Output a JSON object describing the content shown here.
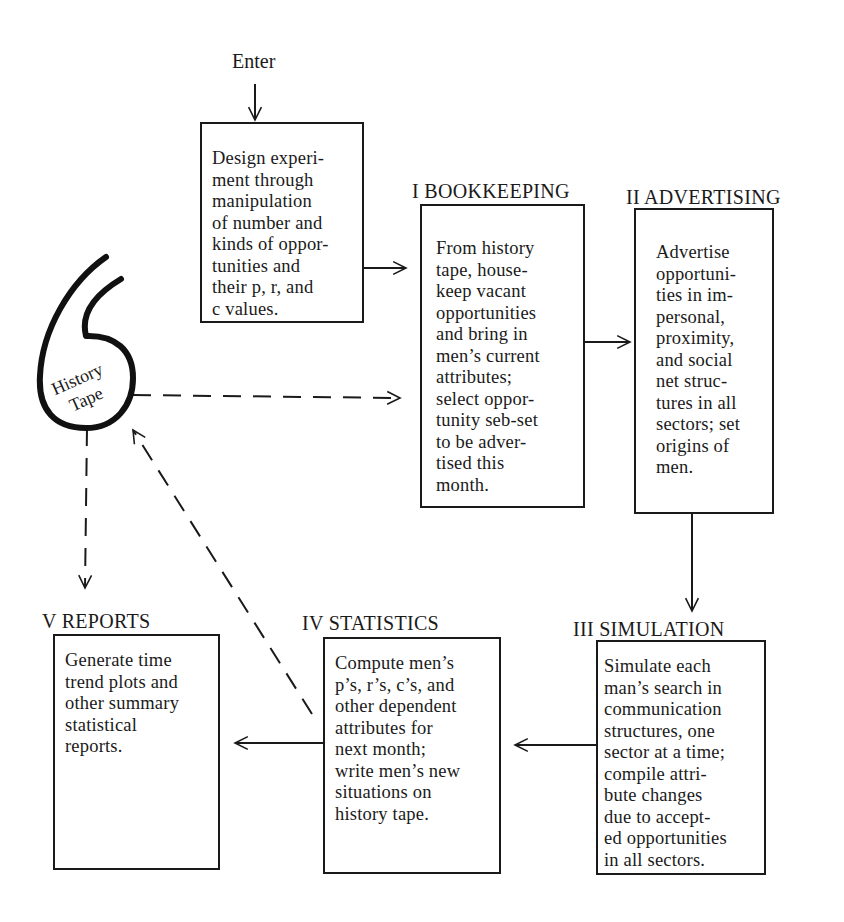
{
  "enter_label": "Enter",
  "history_tape": {
    "label": "History\nTape"
  },
  "design_box": {
    "text": "Design experi-\nment through\nmanipulation\nof number and\nkinds of oppor-\ntunities and\ntheir p, r, and\nc values."
  },
  "stages": [
    {
      "numeral": "I",
      "title": "I BOOKKEEPING",
      "text": "From history\ntape, house-\nkeep vacant\nopportunities\nand bring in\nmen’s current\nattributes;\nselect oppor-\ntunity seb-set\nto be adver-\ntised this\nmonth."
    },
    {
      "numeral": "II",
      "title": "II ADVERTISING",
      "text": "Advertise\nopportuni-\nties in im-\npersonal,\nproximity,\nand social\nnet struc-\ntures in all\nsectors; set\norigins of\nmen."
    },
    {
      "numeral": "III",
      "title": "III  SIMULATION",
      "text": "Simulate each\nman’s search in\ncommunication\nstructures, one\nsector at a time;\ncompile attri-\nbute changes\ndue to accept-\ned opportunities\nin all sectors."
    },
    {
      "numeral": "IV",
      "title": "IV  STATISTICS",
      "text": "Compute men’s\np’s, r’s, c’s, and\nother dependent\nattributes for\nnext month;\nwrite men’s new\nsituations on\nhistory tape."
    },
    {
      "numeral": "V",
      "title": "V   REPORTS",
      "text": "Generate time\ntrend plots and\nother summary\nstatistical\nreports."
    }
  ],
  "colors": {
    "ink": "#1a1a1a",
    "background": "#ffffff"
  }
}
